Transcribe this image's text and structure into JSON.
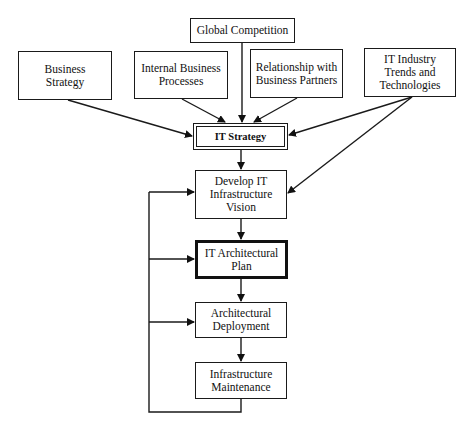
{
  "diagram": {
    "type": "flowchart",
    "nodes": {
      "global_competition": "Global Competition",
      "business_strategy": "Business\nStrategy",
      "internal_business_processes": "Internal Business\nProcesses",
      "relationship_partners": "Relationship with\nBusiness Partners",
      "it_industry_trends": "IT Industry\nTrends and\nTechnologies",
      "it_strategy": "IT Strategy",
      "develop_it_infrastructure_vision": "Develop IT\nInfrastructure\nVision",
      "it_architectural_plan": "IT Architectural\nPlan",
      "architectural_deployment": "Architectural\nDeployment",
      "infrastructure_maintenance": "Infrastructure\nMaintenance"
    },
    "edges": [
      [
        "global_competition",
        "it_strategy"
      ],
      [
        "business_strategy",
        "it_strategy"
      ],
      [
        "internal_business_processes",
        "it_strategy"
      ],
      [
        "relationship_partners",
        "it_strategy"
      ],
      [
        "it_industry_trends",
        "it_strategy"
      ],
      [
        "it_industry_trends",
        "develop_it_infrastructure_vision"
      ],
      [
        "it_strategy",
        "develop_it_infrastructure_vision"
      ],
      [
        "develop_it_infrastructure_vision",
        "it_architectural_plan"
      ],
      [
        "it_architectural_plan",
        "architectural_deployment"
      ],
      [
        "architectural_deployment",
        "infrastructure_maintenance"
      ],
      [
        "infrastructure_maintenance",
        "develop_it_infrastructure_vision"
      ],
      [
        "infrastructure_maintenance",
        "it_architectural_plan"
      ],
      [
        "infrastructure_maintenance",
        "architectural_deployment"
      ]
    ],
    "colors": {
      "stroke": "#1a1a1a",
      "background": "#ffffff"
    }
  }
}
